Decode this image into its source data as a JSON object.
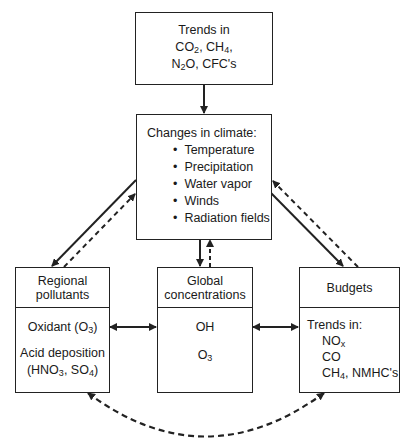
{
  "diagram": {
    "trends_box": {
      "line1": "Trends in",
      "line2": {
        "a": "CO",
        "a_sub": "2",
        "b": ", CH",
        "b_sub": "4",
        "c": ","
      },
      "line3": {
        "a": "N",
        "a_sub": "2",
        "b": "O, CFC's"
      }
    },
    "climate_box": {
      "title": "Changes in climate:",
      "items": [
        "Temperature",
        "Precipitation",
        "Water vapor",
        "Winds",
        "Radiation fields"
      ]
    },
    "regional_box": {
      "header_line1": "Regional",
      "header_line2": "pollutants",
      "item1": {
        "a": "Oxidant (O",
        "sub": "3",
        "b": ")"
      },
      "item2": "Acid deposition",
      "item3": {
        "a": "(HNO",
        "sub1": "3",
        "b": ", SO",
        "sub2": "4",
        "c": ")"
      }
    },
    "global_box": {
      "header_line1": "Global",
      "header_line2": "concentrations",
      "item1": "OH",
      "item2": {
        "a": "O",
        "sub": "3"
      }
    },
    "budgets_box": {
      "header": "Budgets",
      "title": "Trends in:",
      "item1": {
        "a": "NO",
        "sub": "x"
      },
      "item2": "CO",
      "item3": {
        "a": "CH",
        "sub": "4",
        "b": ", NMHC's"
      }
    },
    "connections": [
      {
        "from": "trends",
        "to": "climate",
        "style": "solid"
      },
      {
        "from": "climate",
        "to": "regional",
        "style": "solid"
      },
      {
        "from": "regional",
        "to": "climate",
        "style": "dashed"
      },
      {
        "from": "climate",
        "to": "global",
        "style": "solid"
      },
      {
        "from": "global",
        "to": "climate",
        "style": "dashed"
      },
      {
        "from": "climate",
        "to": "budgets",
        "style": "solid"
      },
      {
        "from": "budgets",
        "to": "climate",
        "style": "dashed"
      },
      {
        "from": "global",
        "to": "regional",
        "style": "solid-bidirectional"
      },
      {
        "from": "global",
        "to": "budgets",
        "style": "solid-bidirectional"
      },
      {
        "from": "regional",
        "to": "budgets",
        "style": "dashed-bidirectional-curve"
      }
    ]
  }
}
